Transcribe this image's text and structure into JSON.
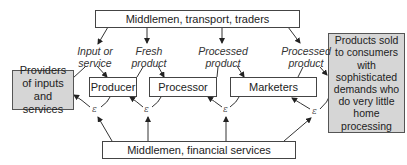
{
  "diagram": {
    "type": "flow",
    "nodes": {
      "top": "Middlemen, transport, traders",
      "providers": [
        "Providers",
        "of inputs",
        "and services"
      ],
      "producer": "Producer",
      "processor": "Processor",
      "marketers": "Marketers",
      "consumers": [
        "Products sold",
        "to consumers",
        "with",
        "sophisticated",
        "demands who",
        "do very little",
        "home",
        "processing"
      ],
      "bottom": "Middlemen, financial services"
    },
    "edge_labels": {
      "input": [
        "Input or",
        "service"
      ],
      "fresh": [
        "Fresh",
        "product"
      ],
      "processed1": [
        "Processed",
        "product"
      ],
      "processed2": [
        "Processed",
        "product"
      ]
    },
    "epsilon_symbol": "ε",
    "colors": {
      "gray_fill": "#d6d6d6",
      "line": "#444444"
    }
  }
}
